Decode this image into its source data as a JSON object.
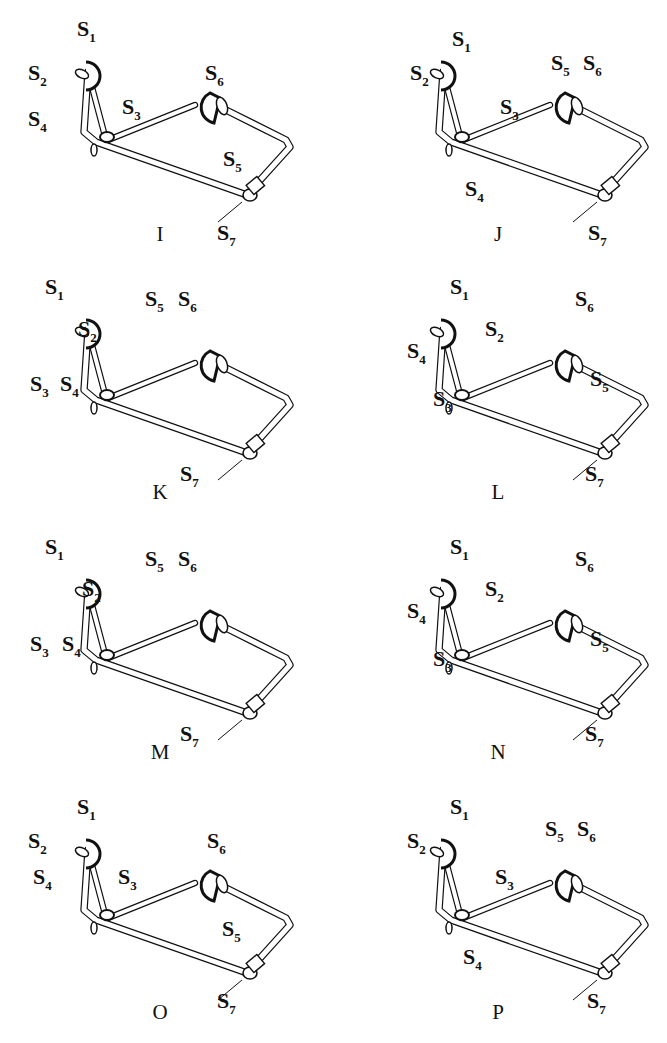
{
  "figure": {
    "panels": [
      {
        "id": "I",
        "caption": "I",
        "col": 0,
        "row": 0,
        "labels": {
          "S1": [
            77,
            18
          ],
          "S2": [
            28,
            62
          ],
          "S3": [
            122,
            96
          ],
          "S4": [
            28,
            108
          ],
          "S5": [
            223,
            148
          ],
          "S6": [
            205,
            62
          ],
          "S7": [
            217,
            222
          ]
        }
      },
      {
        "id": "J",
        "caption": "J",
        "col": 1,
        "row": 0,
        "labels": {
          "S1": [
            97,
            28
          ],
          "S2": [
            55,
            62
          ],
          "S3": [
            145,
            96
          ],
          "S4": [
            110,
            178
          ],
          "S5": [
            196,
            52
          ],
          "S6": [
            228,
            52
          ],
          "S7": [
            233,
            222
          ]
        }
      },
      {
        "id": "K",
        "caption": "K",
        "col": 0,
        "row": 1,
        "labels": {
          "S1": [
            45,
            18
          ],
          "S2": [
            78,
            60
          ],
          "S3": [
            30,
            115
          ],
          "S4": [
            60,
            115
          ],
          "S5": [
            145,
            30
          ],
          "S6": [
            178,
            30
          ],
          "S7": [
            180,
            205
          ]
        }
      },
      {
        "id": "L",
        "caption": "L",
        "col": 1,
        "row": 1,
        "labels": {
          "S1": [
            95,
            18
          ],
          "S2": [
            130,
            60
          ],
          "S3": [
            78,
            130
          ],
          "S4": [
            52,
            82
          ],
          "S5": [
            235,
            110
          ],
          "S6": [
            220,
            30
          ],
          "S7": [
            230,
            205
          ]
        }
      },
      {
        "id": "M",
        "caption": "M",
        "col": 0,
        "row": 2,
        "labels": {
          "S1": [
            45,
            18
          ],
          "S2": [
            82,
            60
          ],
          "S3": [
            30,
            115
          ],
          "S4": [
            62,
            115
          ],
          "S5": [
            145,
            30
          ],
          "S6": [
            178,
            30
          ],
          "S7": [
            180,
            205
          ]
        }
      },
      {
        "id": "N",
        "caption": "N",
        "col": 1,
        "row": 2,
        "labels": {
          "S1": [
            95,
            18
          ],
          "S2": [
            130,
            60
          ],
          "S3": [
            78,
            130
          ],
          "S4": [
            52,
            82
          ],
          "S5": [
            235,
            110
          ],
          "S6": [
            220,
            30
          ],
          "S7": [
            230,
            205
          ]
        }
      },
      {
        "id": "O",
        "caption": "O",
        "col": 0,
        "row": 3,
        "labels": {
          "S1": [
            77,
            18
          ],
          "S2": [
            28,
            52
          ],
          "S3": [
            118,
            88
          ],
          "S4": [
            33,
            88
          ],
          "S5": [
            222,
            140
          ],
          "S6": [
            207,
            52
          ],
          "S7": [
            217,
            212
          ]
        }
      },
      {
        "id": "P",
        "caption": "P",
        "col": 1,
        "row": 3,
        "labels": {
          "S1": [
            95,
            18
          ],
          "S2": [
            52,
            52
          ],
          "S3": [
            140,
            88
          ],
          "S4": [
            108,
            168
          ],
          "S5": [
            190,
            40
          ],
          "S6": [
            222,
            40
          ],
          "S7": [
            232,
            212
          ]
        }
      }
    ],
    "joint_prefix": "S",
    "ink_color": "#111111",
    "background": "#ffffff"
  }
}
